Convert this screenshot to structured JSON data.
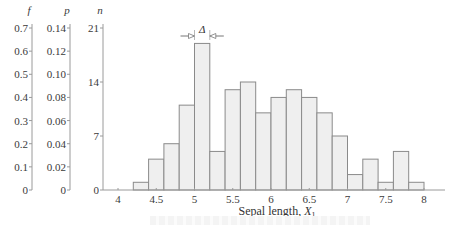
{
  "chart_data": {
    "type": "bar",
    "title": "",
    "xlabel": "Sepal length, X1",
    "xlabel_main": "Sepal length, ",
    "xlabel_var": "X",
    "xlabel_sub": "1",
    "bin_width": 0.2,
    "annotation": "Δ",
    "bin_edges": [
      4.2,
      4.4,
      4.6,
      4.8,
      5.0,
      5.2,
      5.4,
      5.6,
      5.8,
      6.0,
      6.2,
      6.4,
      6.6,
      6.8,
      7.0,
      7.2,
      7.4,
      7.6,
      7.8,
      8.0
    ],
    "categories": [
      "4.2-4.4",
      "4.4-4.6",
      "4.6-4.8",
      "4.8-5.0",
      "5.0-5.2",
      "5.2-5.4",
      "5.4-5.6",
      "5.6-5.8",
      "5.8-6.0",
      "6.0-6.2",
      "6.2-6.4",
      "6.4-6.6",
      "6.6-6.8",
      "6.8-7.0",
      "7.0-7.2",
      "7.2-7.4",
      "7.4-7.6",
      "7.6-7.8",
      "7.8-8.0"
    ],
    "values": [
      1,
      4,
      6,
      11,
      19,
      5,
      13,
      14,
      10,
      12,
      13,
      12,
      10,
      7,
      2,
      4,
      1,
      5,
      1
    ],
    "xticks": [
      "4",
      "4.5",
      "5",
      "5.5",
      "6",
      "6.5",
      "7",
      "7.5",
      "8"
    ],
    "xlim": [
      3.8,
      8.3
    ],
    "y_axes": [
      {
        "name": "f",
        "ticks": [
          "0",
          "0.1",
          "0.2",
          "0.3",
          "0.4",
          "0.5",
          "0.6",
          "0.7"
        ],
        "ylim": [
          0,
          0.7
        ]
      },
      {
        "name": "p",
        "ticks": [
          "0",
          "0.02",
          "0.04",
          "0.06",
          "0.08",
          "0.10",
          "0.12",
          "0.14"
        ],
        "ylim": [
          0,
          0.14
        ]
      },
      {
        "name": "n",
        "ticks": [
          "0",
          "7",
          "14",
          "21"
        ],
        "ylim": [
          0,
          21
        ]
      }
    ],
    "grid": false,
    "legend": null
  },
  "colors": {
    "bar_fill": "#efefef",
    "bar_stroke": "#8a8a8a",
    "axis": "#9a9a9a"
  }
}
